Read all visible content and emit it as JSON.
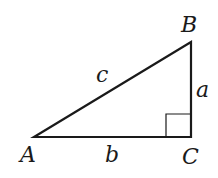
{
  "diagram": {
    "type": "right-triangle",
    "stroke_color": "#1a1a1a",
    "background": "#ffffff",
    "vertices": {
      "A": {
        "label": "A",
        "x": 34,
        "y": 137
      },
      "B": {
        "label": "B",
        "x": 191,
        "y": 42
      },
      "C": {
        "label": "C",
        "x": 191,
        "y": 137
      }
    },
    "sides": {
      "a": {
        "label": "a",
        "between": [
          "B",
          "C"
        ]
      },
      "b": {
        "label": "b",
        "between": [
          "A",
          "C"
        ]
      },
      "c": {
        "label": "c",
        "between": [
          "A",
          "B"
        ]
      }
    },
    "right_angle_at": "C"
  }
}
